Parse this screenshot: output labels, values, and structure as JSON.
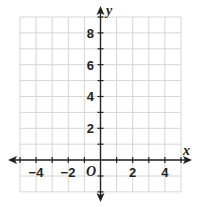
{
  "diagram": {
    "type": "coordinate-plane",
    "x_axis_label": "x",
    "y_axis_label": "y",
    "origin_label": "O",
    "x_range": [
      -5,
      5
    ],
    "y_range": [
      -2,
      9
    ],
    "x_tick_labels": [
      "−4",
      "−2",
      "2",
      "4"
    ],
    "y_tick_labels": [
      "2",
      "4",
      "6",
      "8"
    ],
    "grid_color": "#d8d8d8",
    "axis_color": "#222222"
  }
}
